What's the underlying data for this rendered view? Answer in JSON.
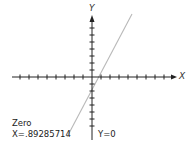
{
  "screen": {
    "title": "Graph",
    "axes": {
      "x_label": "X",
      "y_label": "Y"
    },
    "result": {
      "mode_label": "Zero",
      "x_readout": "X=.89285714",
      "y_readout": "Y=0"
    },
    "colors": {
      "axis": "#222222",
      "plot_line": "#b8b8b8",
      "text": "#222222",
      "background": "#ffffff"
    }
  }
}
